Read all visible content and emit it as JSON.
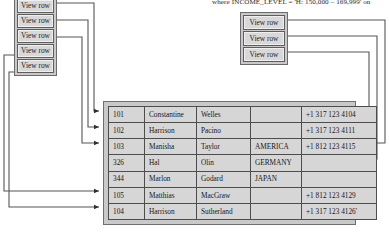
{
  "caption": {
    "text": "where INCOME_LEVEL = 'H: 150,000 – 169,999' on"
  },
  "colors": {
    "panel_fill": "#c9c9c9",
    "cell_fill": "#d6d6d6",
    "button_fill": "#d8d8d8",
    "line": "#4d4d4d",
    "text": "#161616"
  },
  "left_stack": {
    "name": "left-view-row-stack",
    "buttons": [
      {
        "label": "View row"
      },
      {
        "label": "View row"
      },
      {
        "label": "View row"
      },
      {
        "label": "View row"
      },
      {
        "label": "View row"
      }
    ]
  },
  "right_stack": {
    "name": "right-view-row-stack",
    "buttons": [
      {
        "label": "View row"
      },
      {
        "label": "View row"
      },
      {
        "label": "View row"
      }
    ]
  },
  "table": {
    "name": "result-rows-table",
    "columns": [
      "id",
      "first_name",
      "last_name",
      "country",
      "phone"
    ],
    "rows": [
      {
        "id": "101",
        "first_name": "Constantine",
        "last_name": "Welles",
        "country": "",
        "phone": "+1 317 123 4104"
      },
      {
        "id": "102",
        "first_name": "Harrison",
        "last_name": "Pacino",
        "country": "",
        "phone": "+1 317 123 4111"
      },
      {
        "id": "103",
        "first_name": "Manisha",
        "last_name": "Taylor",
        "country": "AMERICA",
        "phone": "+1 812 123 4115"
      },
      {
        "id": "326",
        "first_name": "Hal",
        "last_name": "Olin",
        "country": "GERMANY",
        "phone": ""
      },
      {
        "id": "344",
        "first_name": "Marlon",
        "last_name": "Godard",
        "country": "JAPAN",
        "phone": ""
      },
      {
        "id": "105",
        "first_name": "Matthias",
        "last_name": "MacGraw",
        "country": "",
        "phone": "+1 812 123 4129"
      },
      {
        "id": "104",
        "first_name": "Harrison",
        "last_name": "Sutherland",
        "country": "",
        "phone": "+1 317 123 4126'"
      }
    ]
  }
}
